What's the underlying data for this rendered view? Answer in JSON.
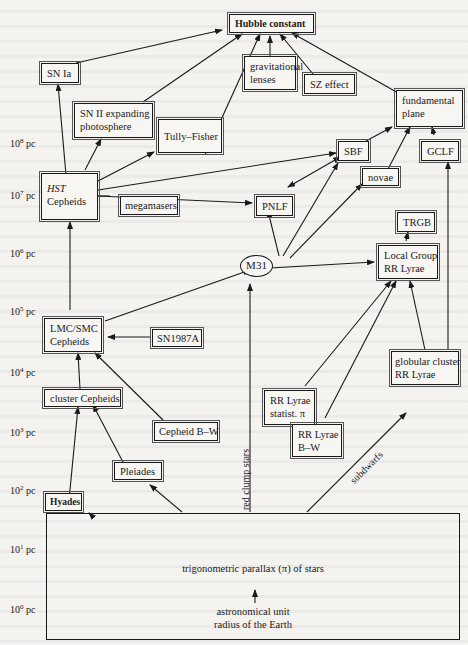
{
  "diagram": {
    "title_node": "Hubble constant",
    "nodes": {
      "hubble_constant": "Hubble constant",
      "sn_ia": "SN Ia",
      "grav_lenses_1": "gravitational",
      "grav_lenses_2": "lenses",
      "sz_effect": "SZ effect",
      "fundamental_plane_1": "fundamental",
      "fundamental_plane_2": "plane",
      "sn_ii_1": "SN II expanding",
      "sn_ii_2": "photosphere",
      "tully_fisher": "Tully–Fisher",
      "hst_cepheids_1": "HST",
      "hst_cepheids_2": "Cepheids",
      "sbf": "SBF",
      "gclf": "GCLF",
      "novae": "novae",
      "megamasers": "megamasers",
      "pnlf": "PNLF",
      "trgb": "TRGB",
      "m31": "M31",
      "local_group_1": "Local Group",
      "local_group_2": "RR Lyrae",
      "lmc_smc_1": "LMC/SMC",
      "lmc_smc_2": "Cepheids",
      "sn1987a": "SN1987A",
      "globular_1": "globular cluster",
      "globular_2": "RR Lyrae",
      "rr_statist_1": "RR Lyrae",
      "rr_statist_2": "statist. π",
      "cluster_cepheids": "cluster Cepheids",
      "cepheid_bw": "Cepheid B–W",
      "rr_bw_1": "RR Lyrae",
      "rr_bw_2": "B–W",
      "pleiades": "Pleiades",
      "hyades": "Hyades",
      "parallax": "trigonometric parallax (π) of stars",
      "au_1": "astronomical unit",
      "au_2": "radius of the Earth"
    },
    "edge_labels": {
      "red_clump": "red clump stars",
      "subdwarfs": "subdwarfs"
    },
    "scale": {
      "unit": "pc",
      "ticks": [
        {
          "base": "10",
          "exp": "8"
        },
        {
          "base": "10",
          "exp": "7"
        },
        {
          "base": "10",
          "exp": "6"
        },
        {
          "base": "10",
          "exp": "5"
        },
        {
          "base": "10",
          "exp": "4"
        },
        {
          "base": "10",
          "exp": "3"
        },
        {
          "base": "10",
          "exp": "2"
        },
        {
          "base": "10",
          "exp": "1"
        },
        {
          "base": "10",
          "exp": "0"
        }
      ]
    }
  }
}
